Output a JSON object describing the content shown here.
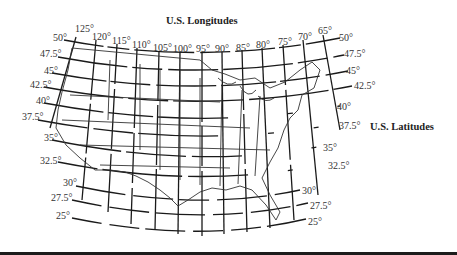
{
  "titles": {
    "longitudes": "U.S. Longitudes",
    "latitudes": "U.S. Latitudes"
  },
  "longitude_labels": [
    {
      "text": "125°",
      "x": 75,
      "y": 27
    },
    {
      "text": "120°",
      "x": 92,
      "y": 32
    },
    {
      "text": "115°",
      "x": 112,
      "y": 37
    },
    {
      "text": "110°",
      "x": 132,
      "y": 41
    },
    {
      "text": "105°",
      "x": 153,
      "y": 44
    },
    {
      "text": "100°",
      "x": 173,
      "y": 45
    },
    {
      "text": "95°",
      "x": 196,
      "y": 45
    },
    {
      "text": "90°",
      "x": 215,
      "y": 45
    },
    {
      "text": "85°",
      "x": 236,
      "y": 44
    },
    {
      "text": "80°",
      "x": 256,
      "y": 41
    },
    {
      "text": "75°",
      "x": 278,
      "y": 38
    },
    {
      "text": "70°",
      "x": 298,
      "y": 33
    },
    {
      "text": "65°",
      "x": 318,
      "y": 27
    }
  ],
  "latitude_labels_left": [
    {
      "text": "50°",
      "x": 53,
      "y": 34
    },
    {
      "text": "47.5°",
      "x": 40,
      "y": 51
    },
    {
      "text": "45°",
      "x": 44,
      "y": 68
    },
    {
      "text": "42.5°",
      "x": 30,
      "y": 82
    },
    {
      "text": "40°",
      "x": 36,
      "y": 97
    },
    {
      "text": "37.5°",
      "x": 22,
      "y": 113
    },
    {
      "text": "35°",
      "x": 44,
      "y": 135
    },
    {
      "text": "32.5°",
      "x": 40,
      "y": 157
    },
    {
      "text": "30°",
      "x": 63,
      "y": 180
    },
    {
      "text": "27.5°",
      "x": 51,
      "y": 194
    },
    {
      "text": "25°",
      "x": 56,
      "y": 212
    }
  ],
  "latitude_labels_right": [
    {
      "text": "50°",
      "x": 339,
      "y": 34
    },
    {
      "text": "47.5°",
      "x": 344,
      "y": 50
    },
    {
      "text": "45°",
      "x": 346,
      "y": 67
    },
    {
      "text": "42.5°",
      "x": 354,
      "y": 82
    },
    {
      "text": "40°",
      "x": 337,
      "y": 103
    },
    {
      "text": "37.5°",
      "x": 339,
      "y": 122
    },
    {
      "text": "35°",
      "x": 323,
      "y": 145
    },
    {
      "text": "32.5°",
      "x": 328,
      "y": 162
    },
    {
      "text": "30°",
      "x": 302,
      "y": 187
    },
    {
      "text": "27.5°",
      "x": 310,
      "y": 202
    },
    {
      "text": "25°",
      "x": 308,
      "y": 218
    }
  ],
  "colors": {
    "line": "#1a1a1a",
    "border": "#333333",
    "background": "#ffffff",
    "bottom_bar": "#1c1c1c"
  }
}
